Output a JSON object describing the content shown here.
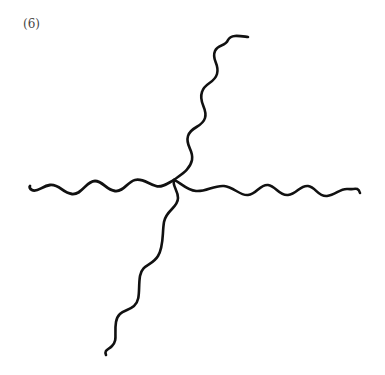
{
  "figure": {
    "label": "(6)",
    "stroke_color": "#111111",
    "arms": [
      {
        "name": "arm-up",
        "direction": "up-right"
      },
      {
        "name": "arm-left",
        "direction": "left"
      },
      {
        "name": "arm-right",
        "direction": "right"
      },
      {
        "name": "arm-down",
        "direction": "down-left"
      }
    ]
  }
}
